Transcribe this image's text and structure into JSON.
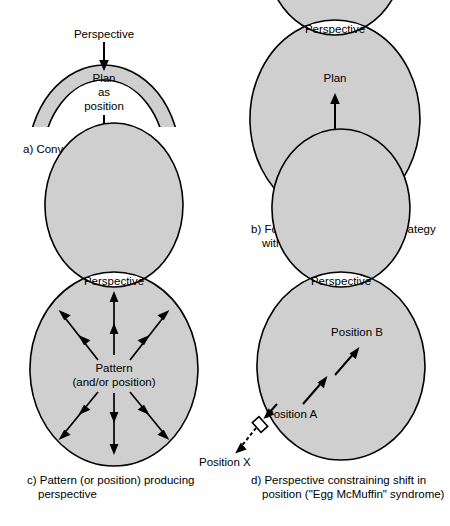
{
  "figure": {
    "fill_color": "#cfcfcf",
    "stroke_color": "#000000",
    "background": "#ffffff"
  },
  "panels": [
    {
      "id": "a",
      "shape": "open-arch",
      "ring_label": "Perspective",
      "inner_labels": [
        "Plan",
        "as",
        "position"
      ],
      "caption": "a) Conventional hierarchy",
      "arrows": [
        {
          "name": "arrow-down-upper",
          "direction": "down"
        },
        {
          "name": "arrow-down-lower",
          "direction": "down"
        }
      ]
    },
    {
      "id": "b",
      "shape": "closed-ellipse",
      "ring_label": "Perspective",
      "inner_labels": [
        "Plan",
        "Pattern",
        "(position, etc.)"
      ],
      "caption_line1": "b) Formalizing on emergent strategy",
      "caption_line2": "within a perspective",
      "arrows": [
        {
          "name": "arrow-up-plan",
          "direction": "up"
        }
      ]
    },
    {
      "id": "c",
      "shape": "closed-ellipse",
      "ring_label": "Perspective",
      "inner_labels": [
        "Pattern",
        "(and/or position)"
      ],
      "caption_line1": "c) Pattern (or position) producing",
      "caption_line2": "perspective",
      "arrows": [
        {
          "name": "ray-up",
          "direction": "up",
          "heads": 2
        },
        {
          "name": "ray-up-left",
          "direction": "up-left",
          "heads": 2
        },
        {
          "name": "ray-up-right",
          "direction": "up-right",
          "heads": 2
        },
        {
          "name": "ray-down",
          "direction": "down",
          "heads": 2
        },
        {
          "name": "ray-down-left",
          "direction": "down-left",
          "heads": 2
        },
        {
          "name": "ray-down-right",
          "direction": "down-right",
          "heads": 2
        }
      ]
    },
    {
      "id": "d",
      "shape": "closed-ellipse",
      "ring_label": "Perspective",
      "inner_labels": [
        "Position B",
        "Position A"
      ],
      "outer_label": "Position X",
      "caption_line1": "d) Perspective constraining shift in",
      "caption_line2": "position (\"Egg McMuffin\" syndrome)",
      "arrows": [
        {
          "name": "arrow-a-to-b-lower",
          "direction": "up-right",
          "style": "solid"
        },
        {
          "name": "arrow-a-to-b-upper",
          "direction": "up-right",
          "style": "solid"
        },
        {
          "name": "arrow-blocked-at-wall",
          "direction": "down-left",
          "style": "solid"
        },
        {
          "name": "arrow-to-position-x",
          "direction": "down-left",
          "style": "dashed"
        }
      ]
    }
  ]
}
